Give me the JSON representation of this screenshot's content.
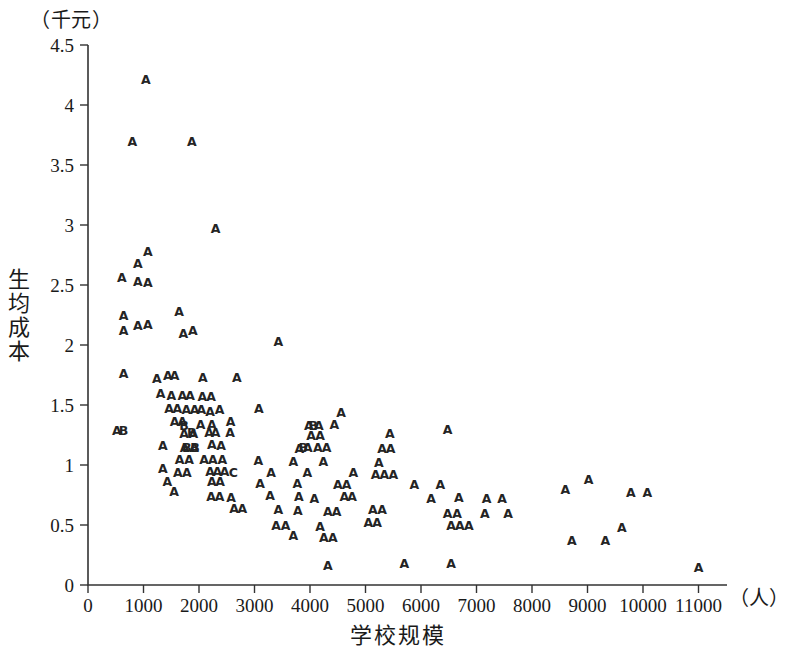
{
  "figure": {
    "y_unit_label": "（千元）",
    "x_unit_label": "（人）",
    "y_axis_title": "生均成本",
    "x_axis_title": "学校规模"
  },
  "chart_data": {
    "type": "scatter",
    "title": "",
    "xlabel": "学校规模",
    "ylabel": "生均成本",
    "x_unit": "（人）",
    "y_unit": "（千元）",
    "xlim": [
      0,
      11400
    ],
    "ylim": [
      0,
      4.5
    ],
    "xticks": [
      0,
      1000,
      2000,
      3000,
      4000,
      5000,
      6000,
      7000,
      8000,
      9000,
      10000,
      11000
    ],
    "xtick_labels": [
      "0",
      "1000",
      "2000",
      "3000",
      "4000",
      "5000",
      "6000",
      "7000",
      "8000",
      "9000",
      "10000",
      "11000"
    ],
    "yticks": [
      0,
      0.5,
      1,
      1.5,
      2,
      2.5,
      3,
      3.5,
      4,
      4.5
    ],
    "ytick_labels": [
      "0",
      "0.5",
      "1",
      "1.5",
      "2",
      "2.5",
      "3",
      "3.5",
      "4",
      "4.5"
    ],
    "grid": false,
    "legend": false,
    "marker_style": "letter-glyph",
    "marker_labels": [
      "A",
      "B",
      "C"
    ],
    "series": [
      {
        "name": "A",
        "marker": "A",
        "points": [
          [
            1040,
            4.21
          ],
          [
            800,
            3.7
          ],
          [
            1870,
            3.7
          ],
          [
            2300,
            2.97
          ],
          [
            610,
            2.56
          ],
          [
            900,
            2.68
          ],
          [
            1080,
            2.78
          ],
          [
            900,
            2.53
          ],
          [
            1080,
            2.52
          ],
          [
            640,
            2.25
          ],
          [
            1640,
            2.28
          ],
          [
            640,
            2.12
          ],
          [
            900,
            2.16
          ],
          [
            1080,
            2.17
          ],
          [
            1720,
            2.1
          ],
          [
            1890,
            2.12
          ],
          [
            3430,
            2.03
          ],
          [
            640,
            1.76
          ],
          [
            1240,
            1.72
          ],
          [
            1440,
            1.75
          ],
          [
            1560,
            1.75
          ],
          [
            2070,
            1.73
          ],
          [
            2680,
            1.73
          ],
          [
            1310,
            1.6
          ],
          [
            1500,
            1.58
          ],
          [
            1700,
            1.58
          ],
          [
            1840,
            1.58
          ],
          [
            2060,
            1.57
          ],
          [
            2220,
            1.57
          ],
          [
            1460,
            1.47
          ],
          [
            1610,
            1.47
          ],
          [
            1770,
            1.46
          ],
          [
            1920,
            1.46
          ],
          [
            2040,
            1.46
          ],
          [
            2200,
            1.45
          ],
          [
            2370,
            1.46
          ],
          [
            3080,
            1.47
          ],
          [
            4560,
            1.44
          ],
          [
            1560,
            1.36
          ],
          [
            1700,
            1.36
          ],
          [
            2030,
            1.34
          ],
          [
            2230,
            1.34
          ],
          [
            2570,
            1.36
          ],
          [
            3980,
            1.33
          ],
          [
            4160,
            1.33
          ],
          [
            4440,
            1.34
          ],
          [
            520,
            1.29
          ],
          [
            1730,
            1.26
          ],
          [
            1900,
            1.26
          ],
          [
            2180,
            1.27
          ],
          [
            2300,
            1.27
          ],
          [
            2560,
            1.27
          ],
          [
            4020,
            1.25
          ],
          [
            4180,
            1.25
          ],
          [
            5440,
            1.26
          ],
          [
            6480,
            1.3
          ],
          [
            1350,
            1.16
          ],
          [
            1740,
            1.15
          ],
          [
            1910,
            1.15
          ],
          [
            2230,
            1.17
          ],
          [
            2400,
            1.16
          ],
          [
            3810,
            1.14
          ],
          [
            3960,
            1.15
          ],
          [
            4140,
            1.15
          ],
          [
            4300,
            1.15
          ],
          [
            5300,
            1.14
          ],
          [
            5450,
            1.14
          ],
          [
            1650,
            1.05
          ],
          [
            1820,
            1.05
          ],
          [
            2090,
            1.05
          ],
          [
            2250,
            1.05
          ],
          [
            2420,
            1.05
          ],
          [
            3070,
            1.04
          ],
          [
            3700,
            1.03
          ],
          [
            4240,
            1.03
          ],
          [
            5240,
            1.02
          ],
          [
            1350,
            0.97
          ],
          [
            1620,
            0.94
          ],
          [
            1780,
            0.94
          ],
          [
            2200,
            0.95
          ],
          [
            2330,
            0.95
          ],
          [
            2460,
            0.95
          ],
          [
            3300,
            0.94
          ],
          [
            3950,
            0.94
          ],
          [
            4780,
            0.94
          ],
          [
            5180,
            0.92
          ],
          [
            5340,
            0.92
          ],
          [
            5500,
            0.92
          ],
          [
            1430,
            0.86
          ],
          [
            2230,
            0.86
          ],
          [
            2380,
            0.86
          ],
          [
            3100,
            0.85
          ],
          [
            3770,
            0.85
          ],
          [
            4500,
            0.84
          ],
          [
            4660,
            0.84
          ],
          [
            5880,
            0.84
          ],
          [
            6350,
            0.84
          ],
          [
            8600,
            0.8
          ],
          [
            9020,
            0.88
          ],
          [
            1550,
            0.78
          ],
          [
            2220,
            0.74
          ],
          [
            2370,
            0.74
          ],
          [
            2580,
            0.73
          ],
          [
            3280,
            0.75
          ],
          [
            3800,
            0.74
          ],
          [
            4080,
            0.72
          ],
          [
            4620,
            0.74
          ],
          [
            4760,
            0.74
          ],
          [
            6180,
            0.72
          ],
          [
            6680,
            0.73
          ],
          [
            7180,
            0.72
          ],
          [
            7460,
            0.72
          ],
          [
            9780,
            0.77
          ],
          [
            10080,
            0.77
          ],
          [
            2630,
            0.64
          ],
          [
            2780,
            0.64
          ],
          [
            3430,
            0.63
          ],
          [
            3780,
            0.62
          ],
          [
            4320,
            0.61
          ],
          [
            4480,
            0.61
          ],
          [
            5130,
            0.63
          ],
          [
            5300,
            0.63
          ],
          [
            6480,
            0.6
          ],
          [
            6650,
            0.6
          ],
          [
            7150,
            0.6
          ],
          [
            7570,
            0.6
          ],
          [
            3390,
            0.5
          ],
          [
            3560,
            0.5
          ],
          [
            4180,
            0.49
          ],
          [
            5050,
            0.52
          ],
          [
            5210,
            0.52
          ],
          [
            6540,
            0.5
          ],
          [
            6700,
            0.5
          ],
          [
            6860,
            0.5
          ],
          [
            9620,
            0.48
          ],
          [
            3700,
            0.41
          ],
          [
            4250,
            0.4
          ],
          [
            4410,
            0.4
          ],
          [
            8720,
            0.37
          ],
          [
            9320,
            0.37
          ],
          [
            4320,
            0.16
          ],
          [
            5700,
            0.18
          ],
          [
            6540,
            0.18
          ],
          [
            11000,
            0.15
          ]
        ]
      },
      {
        "name": "B",
        "marker": "B",
        "points": [
          [
            640,
            1.29
          ],
          [
            1730,
            1.33
          ],
          [
            1870,
            1.27
          ],
          [
            1780,
            1.15
          ],
          [
            1930,
            1.15
          ],
          [
            4060,
            1.33
          ],
          [
            3880,
            1.15
          ]
        ]
      },
      {
        "name": "C",
        "marker": "C",
        "points": [
          [
            2620,
            0.94
          ]
        ]
      }
    ]
  }
}
